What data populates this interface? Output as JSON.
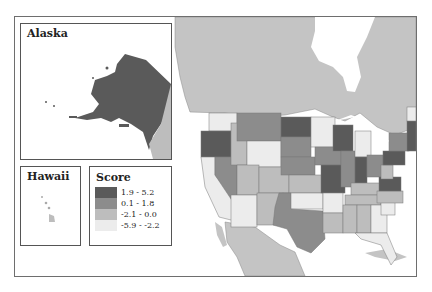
{
  "insets": {
    "alaska": {
      "title": "Alaska"
    },
    "hawaii": {
      "title": "Hawaii"
    }
  },
  "legend": {
    "title": "Score",
    "items": [
      {
        "label": "1.9 - 5.2",
        "color": "#5a5a5a"
      },
      {
        "label": "0.1 - 1.8",
        "color": "#8c8c8c"
      },
      {
        "label": "-2.1 - 0.0",
        "color": "#bdbdbd"
      },
      {
        "label": "-5.9 - -2.2",
        "color": "#ececec"
      }
    ]
  },
  "colors": {
    "background_land": "#c4c4c4",
    "water": "#ffffff",
    "border": "#6e6e6e"
  }
}
